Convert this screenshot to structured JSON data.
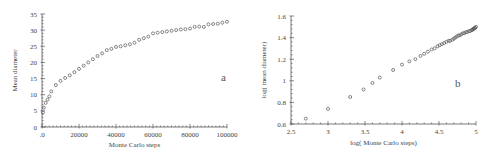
{
  "chart_data": [
    {
      "type": "scatter",
      "panel_label": "a",
      "title": "",
      "xlabel": "Monte Carlo steps",
      "ylabel": "Mean diameter",
      "xlim": [
        0,
        100000
      ],
      "ylim": [
        0,
        35
      ],
      "grid": false,
      "x_ticks": [
        0,
        20000,
        40000,
        60000,
        80000,
        100000
      ],
      "x_tick_labels": [
        ".0",
        "20000",
        "40000",
        "60000",
        "80000",
        "100000"
      ],
      "y_ticks": [
        0,
        5,
        10,
        15,
        20,
        25,
        30,
        35
      ],
      "y_tick_labels": [
        "0",
        "5",
        "10",
        "15",
        "20",
        "25",
        "30",
        "35"
      ],
      "series": [
        {
          "name": "mean diameter",
          "marker": "open-circle",
          "x": [
            500,
            1000,
            2000,
            3000,
            4000,
            5000,
            7500,
            10000,
            12500,
            15000,
            17500,
            20000,
            22500,
            25000,
            27500,
            30000,
            32500,
            35000,
            37500,
            40000,
            42500,
            45000,
            47500,
            50000,
            52500,
            55000,
            57500,
            60000,
            62500,
            65000,
            67500,
            70000,
            72500,
            75000,
            77500,
            80000,
            82500,
            85000,
            87500,
            90000,
            92500,
            95000,
            97500,
            100000
          ],
          "y": [
            4.5,
            6,
            7.5,
            8.5,
            9.5,
            11,
            13,
            14.3,
            15.2,
            16,
            17,
            18,
            19,
            20,
            21,
            22,
            22.8,
            23.8,
            24.2,
            24.8,
            25,
            25.3,
            25.6,
            26.1,
            27,
            27.5,
            28,
            29,
            29.2,
            29.4,
            29.6,
            29.8,
            30,
            30.2,
            30.3,
            30.5,
            31,
            31.1,
            31,
            31.8,
            31.9,
            32,
            32.3,
            32.6
          ]
        }
      ]
    },
    {
      "type": "scatter",
      "panel_label": "b",
      "title": "",
      "xlabel": "log( Monte Carlo steps)",
      "ylabel": "log( mean diameter)",
      "xlim": [
        2.5,
        5
      ],
      "ylim": [
        0.6,
        1.6
      ],
      "grid": false,
      "x_ticks": [
        2.5,
        3,
        3.5,
        4,
        4.5,
        5
      ],
      "x_tick_labels": [
        "2.5",
        "3",
        "3.5",
        "4",
        "4.5",
        "5"
      ],
      "y_ticks": [
        0.6,
        0.8,
        1.0,
        1.2,
        1.4,
        1.6
      ],
      "y_tick_labels": [
        "0.6",
        "0.8",
        "1",
        "1.2",
        "1.4",
        "1.6"
      ],
      "series": [
        {
          "name": "log mean diameter",
          "marker": "open-circle",
          "x": [
            2.7,
            3.0,
            3.3,
            3.48,
            3.6,
            3.7,
            3.88,
            4.0,
            4.1,
            4.18,
            4.25,
            4.3,
            4.35,
            4.4,
            4.44,
            4.48,
            4.51,
            4.54,
            4.57,
            4.6,
            4.63,
            4.65,
            4.68,
            4.7,
            4.72,
            4.74,
            4.76,
            4.78,
            4.8,
            4.82,
            4.84,
            4.86,
            4.88,
            4.9,
            4.92,
            4.94,
            4.95,
            4.96,
            4.97,
            4.98,
            4.99,
            5.0
          ],
          "y": [
            0.65,
            0.74,
            0.85,
            0.92,
            0.98,
            1.03,
            1.1,
            1.15,
            1.18,
            1.2,
            1.23,
            1.25,
            1.27,
            1.29,
            1.3,
            1.32,
            1.33,
            1.34,
            1.35,
            1.36,
            1.37,
            1.37,
            1.38,
            1.39,
            1.4,
            1.41,
            1.42,
            1.42,
            1.43,
            1.44,
            1.44,
            1.45,
            1.45,
            1.46,
            1.46,
            1.47,
            1.47,
            1.48,
            1.48,
            1.49,
            1.49,
            1.5
          ]
        }
      ]
    }
  ]
}
